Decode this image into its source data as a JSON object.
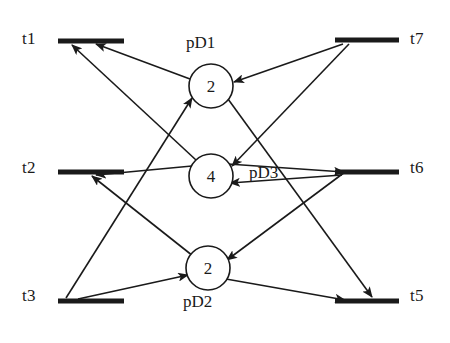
{
  "diagram": {
    "type": "petri-net",
    "title": "",
    "transitions": [
      {
        "id": "t1",
        "label": "t1",
        "label_x": 22,
        "label_y": 29,
        "bar_x1": 58,
        "bar_y1": 41,
        "bar_x2": 124,
        "bar_y2": 41
      },
      {
        "id": "t2",
        "label": "t2",
        "label_x": 22,
        "label_y": 158,
        "bar_x1": 58,
        "bar_y1": 172,
        "bar_x2": 124,
        "bar_y2": 172
      },
      {
        "id": "t3",
        "label": "t3",
        "label_x": 22,
        "label_y": 286,
        "bar_x1": 58,
        "bar_y1": 301,
        "bar_x2": 124,
        "bar_y2": 301
      },
      {
        "id": "t7",
        "label": "t7",
        "label_x": 410,
        "label_y": 29,
        "bar_x1": 335,
        "bar_y1": 40,
        "bar_x2": 399,
        "bar_y2": 40
      },
      {
        "id": "t6",
        "label": "t6",
        "label_x": 410,
        "label_y": 158,
        "bar_x1": 335,
        "bar_y1": 172,
        "bar_x2": 399,
        "bar_y2": 172
      },
      {
        "id": "t5",
        "label": "t5",
        "label_x": 410,
        "label_y": 286,
        "bar_x1": 335,
        "bar_y1": 301,
        "bar_x2": 399,
        "bar_y2": 301
      }
    ],
    "places": [
      {
        "id": "pD1",
        "label": "pD1",
        "tokens": "2",
        "cx": 211,
        "cy": 86,
        "r": 22,
        "label_x": 186,
        "label_y": 33
      },
      {
        "id": "pD3",
        "label": "pD3",
        "tokens": "4",
        "cx": 211,
        "cy": 176,
        "r": 22,
        "label_x": 249,
        "label_y": 163
      },
      {
        "id": "pD2",
        "label": "pD2",
        "tokens": "2",
        "cx": 208,
        "cy": 268,
        "r": 22,
        "label_x": 183,
        "label_y": 292
      }
    ],
    "arcs": [
      {
        "from": "pD1",
        "to": "t1",
        "x1": 190,
        "y1": 79,
        "x2": 96,
        "y2": 44
      },
      {
        "from": "pD3",
        "to": "t1",
        "x1": 196,
        "y1": 160,
        "x2": 72,
        "y2": 45
      },
      {
        "from": "t3",
        "to": "pD1",
        "x1": 66,
        "y1": 298,
        "x2": 192,
        "y2": 98
      },
      {
        "from": "t7",
        "to": "pD1",
        "x1": 343,
        "y1": 44,
        "x2": 234,
        "y2": 82
      },
      {
        "from": "pD1",
        "to": "t5",
        "x1": 228,
        "y1": 99,
        "x2": 372,
        "y2": 297
      },
      {
        "from": "t7",
        "to": "pD3",
        "x1": 349,
        "y1": 44,
        "x2": 232,
        "y2": 166
      },
      {
        "from": "pD3",
        "to": "t2",
        "x1": 192,
        "y1": 166,
        "x2": 96,
        "y2": 175
      },
      {
        "from": "t6",
        "to": "pD3",
        "x1": 342,
        "y1": 175,
        "x2": 230,
        "y2": 183
      },
      {
        "from": "pD2",
        "to": "t2",
        "x1": 193,
        "y1": 256,
        "x2": 92,
        "y2": 176
      },
      {
        "from": "t3",
        "to": "pD2",
        "x1": 78,
        "y1": 299,
        "x2": 188,
        "y2": 275
      },
      {
        "from": "pD3",
        "to": "t6",
        "x1": 228,
        "y1": 164,
        "x2": 344,
        "y2": 172
      },
      {
        "from": "t7",
        "to": "pD2",
        "x1": 345,
        "y1": 172,
        "x2": 227,
        "y2": 260
      },
      {
        "from": "pD2",
        "to": "t5",
        "x1": 226,
        "y1": 279,
        "x2": 345,
        "y2": 300
      }
    ]
  },
  "style": {
    "ink": "#1a1a1a",
    "background": "#ffffff",
    "stroke_width": 1.6,
    "bar_thickness": 5
  }
}
